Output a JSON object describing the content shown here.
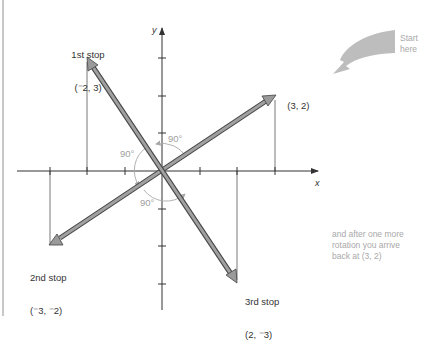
{
  "figure": {
    "type": "rotation-diagram",
    "axes": {
      "x_label": "x",
      "y_label": "y"
    },
    "origin_px": [
      162,
      171
    ],
    "unit_px": 37.5,
    "colors": {
      "axis": "#333333",
      "vector_fill": "#9a9a9a",
      "vector_stroke": "#444444",
      "angle_arc": "#a8a8a8",
      "start_arrow": "#bdbdbd",
      "note_text": "#a8a8a8"
    }
  },
  "points": [
    {
      "id": "start",
      "label_line1": "",
      "label_line2": "(3, 2)",
      "x": 3,
      "y": 2
    },
    {
      "id": "first",
      "label_line1": "1st stop",
      "label_line2": "(⁻2, 3)",
      "x": -2,
      "y": 3
    },
    {
      "id": "second",
      "label_line1": "2nd stop",
      "label_line2": "(⁻3, ⁻2)",
      "x": -3,
      "y": -2
    },
    {
      "id": "third",
      "label_line1": "3rd stop",
      "label_line2": "(2, ⁻3)",
      "x": 2,
      "y": -3
    }
  ],
  "angles": [
    "90°",
    "90°",
    "90°"
  ],
  "start_note": "Start\nhere",
  "end_note": "and after one more\nrotation you arrive\nback at (3, 2)"
}
